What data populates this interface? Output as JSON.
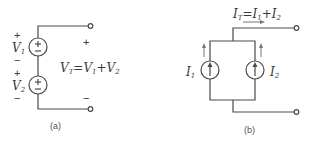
{
  "diagram_a": {
    "caption": "(a)",
    "sources": [
      {
        "name": "V",
        "sub": "1",
        "top_sign": "+",
        "bottom_sign": "−"
      },
      {
        "name": "V",
        "sub": "2",
        "top_sign": "+",
        "bottom_sign": "−"
      }
    ],
    "terminal_top_sign": "+",
    "terminal_bottom_sign": "−",
    "equation": {
      "lhs": "V",
      "lhs_sub": "T",
      "eq": "=",
      "t1": "V",
      "t1_sub": "1",
      "plus": "+",
      "t2": "V",
      "t2_sub": "2"
    }
  },
  "diagram_b": {
    "caption": "(b)",
    "sources": [
      {
        "name": "I",
        "sub": "1"
      },
      {
        "name": "I",
        "sub": "2"
      }
    ],
    "equation": {
      "lhs": "I",
      "lhs_sub": "T",
      "eq": "=",
      "t1": "I",
      "t1_sub": "1",
      "plus": "+",
      "t2": "I",
      "t2_sub": "2"
    }
  },
  "colors": {
    "line": "#4a4a4a",
    "text": "#3a3a3a",
    "arrow": "#777777"
  }
}
